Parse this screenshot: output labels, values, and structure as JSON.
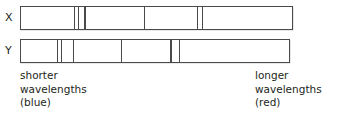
{
  "figure": {
    "type": "absorption-spectra-comparison",
    "background_color": "#ffffff",
    "line_color": "#4a4a4a",
    "text_color": "#231f20",
    "width": 337,
    "height": 124
  },
  "spectra": [
    {
      "label": "X",
      "label_x": 5,
      "label_y": 12,
      "bar": {
        "x": 20,
        "y": 6,
        "width": 273,
        "height": 24
      },
      "absorption_lines_x": [
        73.3,
        77.3,
        84.0,
        143.3,
        196.7,
        201.7
      ],
      "line_width": 1.3
    },
    {
      "label": "Y",
      "label_x": 5,
      "label_y": 45,
      "bar": {
        "x": 20,
        "y": 39,
        "width": 270,
        "height": 24
      },
      "absorption_lines_x": [
        56.7,
        60.7,
        72.7,
        120.7,
        170.0,
        178.3
      ],
      "line_width": 1.3
    }
  ],
  "captions": [
    {
      "name": "left-caption",
      "lines": [
        "shorter",
        "wavelengths",
        "(blue)"
      ],
      "text": "shorter\nwavelengths\n(blue)",
      "x": 20,
      "y": 69
    },
    {
      "name": "right-caption",
      "lines": [
        "longer",
        "wavelengths",
        "(red)"
      ],
      "text": "longer\nwavelengths\n(red)",
      "x": 255,
      "y": 69
    }
  ]
}
